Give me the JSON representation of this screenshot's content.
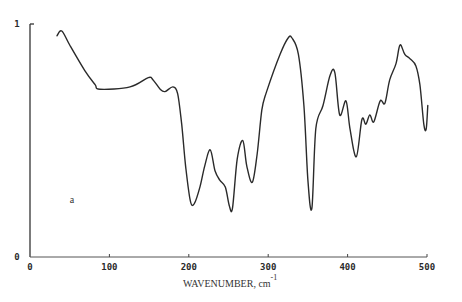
{
  "chart_data": {
    "type": "line",
    "title": "",
    "xlabel": "WAVENUMBER, cm",
    "xlabel_superscript": "-1",
    "ylabel": "",
    "xlim": [
      0,
      500
    ],
    "ylim": [
      0,
      1
    ],
    "x_ticks": [
      0,
      100,
      200,
      300,
      400,
      500
    ],
    "x_tick_labels": [
      "0",
      "100",
      "200",
      "300",
      "400",
      "500"
    ],
    "y_ticks": [
      0,
      1
    ],
    "y_tick_labels": [
      "0",
      "1"
    ],
    "grid": false,
    "legend": null,
    "annotations": [
      {
        "text": "a",
        "x": 50,
        "y": 0.23
      }
    ],
    "series": [
      {
        "name": "a",
        "color": "#2a2a2a",
        "x": [
          34,
          40,
          50,
          69,
          82,
          88,
          126,
          149,
          155,
          164,
          170,
          180,
          186,
          191,
          196,
          202,
          207,
          214,
          220,
          227,
          233,
          239,
          246,
          251,
          255,
          261,
          268,
          273,
          280,
          286,
          292,
          298,
          315,
          325,
          330,
          338,
          345,
          350,
          355,
          360,
          369,
          378,
          384,
          390,
          398,
          403,
          411,
          418,
          423,
          428,
          433,
          441,
          447,
          453,
          461,
          466,
          472,
          479,
          486,
          491,
          496,
          499,
          501
        ],
        "y": [
          0.95,
          0.97,
          0.91,
          0.8,
          0.74,
          0.72,
          0.73,
          0.77,
          0.76,
          0.72,
          0.71,
          0.73,
          0.7,
          0.57,
          0.39,
          0.24,
          0.23,
          0.3,
          0.39,
          0.46,
          0.37,
          0.33,
          0.3,
          0.22,
          0.21,
          0.42,
          0.5,
          0.39,
          0.32,
          0.44,
          0.63,
          0.71,
          0.87,
          0.94,
          0.94,
          0.87,
          0.65,
          0.33,
          0.21,
          0.55,
          0.65,
          0.78,
          0.79,
          0.61,
          0.67,
          0.55,
          0.43,
          0.59,
          0.57,
          0.61,
          0.58,
          0.67,
          0.66,
          0.76,
          0.83,
          0.91,
          0.87,
          0.85,
          0.82,
          0.74,
          0.57,
          0.55,
          0.65
        ]
      }
    ]
  },
  "plot_area": {
    "x0": 30,
    "y0": 257,
    "x1": 427,
    "y1": 24
  }
}
